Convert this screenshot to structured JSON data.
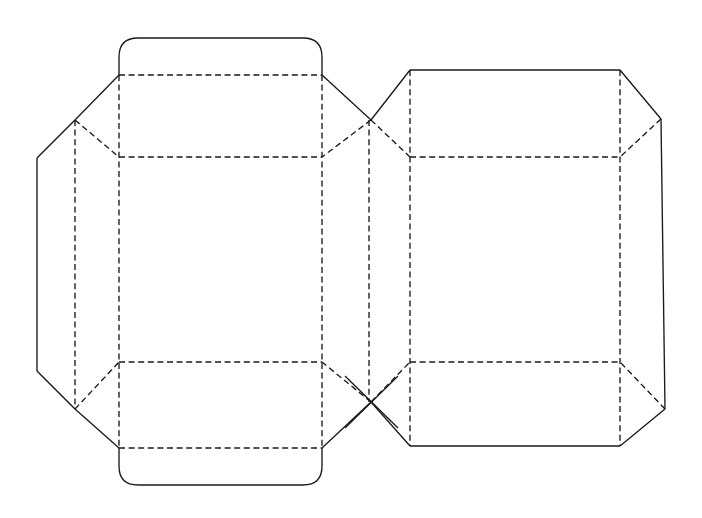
{
  "document": {
    "title": "Carton Dieline Flat Layout",
    "kind": "packaging-dieline-technical-drawing",
    "background_color": "#ffffff",
    "line_color": "#1a1a1a",
    "canvas": {
      "width": 702,
      "height": 518
    }
  },
  "legend": {
    "cut_line_label": "Cut line (solid)",
    "crease_line_label": "Crease / fold line (dashed)"
  },
  "geometry": {
    "cut_lines": [
      {
        "name": "top-tuck-flap-outline",
        "d": "M 119 75 L 119 57 Q 119 38 138 38 L 303 38 Q 322 38 322 57 L 322 75"
      },
      {
        "name": "bottom-tuck-flap-outline",
        "d": "M 119 448 L 119 466 Q 119 485 138 485 L 303 485 Q 322 485 322 466 L 322 448"
      },
      {
        "name": "top-left-diagonal-upper",
        "d": "M 119 75 L 75 120"
      },
      {
        "name": "top-left-diagonal-lower",
        "d": "M 75 120 L 37 158"
      },
      {
        "name": "left-edge-vertical",
        "d": "M 37 158 L 37 371"
      },
      {
        "name": "bottom-left-diagonal-lower",
        "d": "M 37 371 L 75 409"
      },
      {
        "name": "bottom-left-diagonal-upper",
        "d": "M 75 409 L 119 448"
      },
      {
        "name": "top-center-diagonal-right",
        "d": "M 322 75 L 371 120"
      },
      {
        "name": "center-x-upper-right",
        "d": "M 371 120 L 410 70"
      },
      {
        "name": "bottom-center-diagonal-right",
        "d": "M 322 448 L 371 402"
      },
      {
        "name": "center-x-lower-right",
        "d": "M 371 402 L 410 446"
      },
      {
        "name": "center-x-stroke-a",
        "d": "M 345 376 L 398 428"
      },
      {
        "name": "center-x-stroke-b",
        "d": "M 345 428 L 398 376"
      },
      {
        "name": "right-panel-top-edge",
        "d": "M 410 70 L 620 70"
      },
      {
        "name": "right-panel-top-right-diagonal",
        "d": "M 620 70 L 661 119"
      },
      {
        "name": "right-edge-vertical",
        "d": "M 661 119 L 665 409"
      },
      {
        "name": "right-panel-bottom-right-diagonal",
        "d": "M 665 409 L 620 446"
      },
      {
        "name": "right-panel-bottom-edge",
        "d": "M 620 446 L 410 446"
      }
    ],
    "crease_lines": [
      {
        "name": "top-horizontal-crease-main",
        "d": "M 119 75 L 322 75"
      },
      {
        "name": "upper-horizontal-crease-main",
        "d": "M 119 157 L 322 157"
      },
      {
        "name": "lower-horizontal-crease-main",
        "d": "M 119 362 L 322 362"
      },
      {
        "name": "bottom-horizontal-crease-main",
        "d": "M 119 448 L 322 448"
      },
      {
        "name": "upper-horizontal-crease-right",
        "d": "M 410 157 L 620 157"
      },
      {
        "name": "lower-horizontal-crease-right",
        "d": "M 410 362 L 620 362"
      },
      {
        "name": "vertical-crease-left-inner",
        "d": "M 75 120 L 75 409"
      },
      {
        "name": "vertical-crease-panel-left",
        "d": "M 119 75 L 119 448"
      },
      {
        "name": "vertical-crease-panel-right",
        "d": "M 322 75 L 322 448"
      },
      {
        "name": "vertical-crease-center-left",
        "d": "M 369 120 L 369 402"
      },
      {
        "name": "vertical-crease-center-right",
        "d": "M 410 70 L 410 446"
      },
      {
        "name": "vertical-crease-right-inner",
        "d": "M 620 70 L 620 446"
      },
      {
        "name": "corner-crease-top-left",
        "d": "M 75 120 L 119 157"
      },
      {
        "name": "corner-crease-bottom-left",
        "d": "M 75 409 L 119 362"
      },
      {
        "name": "corner-crease-top-center-left",
        "d": "M 371 120 L 322 157"
      },
      {
        "name": "corner-crease-bottom-center-left",
        "d": "M 371 402 L 322 362"
      },
      {
        "name": "corner-crease-top-center-right",
        "d": "M 371 120 L 410 157"
      },
      {
        "name": "corner-crease-bottom-center-right",
        "d": "M 371 402 L 410 362"
      },
      {
        "name": "corner-crease-top-right",
        "d": "M 661 119 L 620 157"
      },
      {
        "name": "corner-crease-bottom-right",
        "d": "M 665 409 L 620 362"
      }
    ]
  }
}
